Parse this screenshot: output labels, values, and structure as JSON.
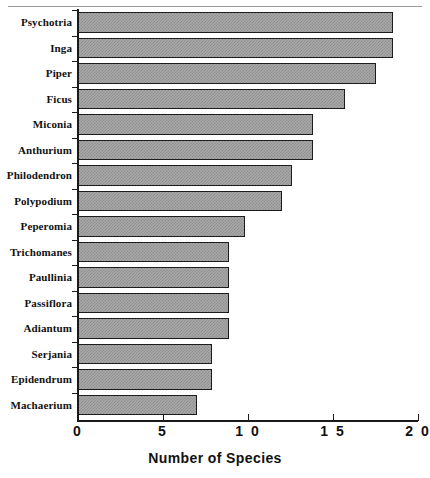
{
  "chart_data": {
    "type": "bar",
    "orientation": "horizontal",
    "title": "",
    "xlabel": "Number of Species",
    "ylabel": "",
    "xlim": [
      0,
      20
    ],
    "ylim": null,
    "grid": false,
    "legend": null,
    "xticks": [
      0,
      5,
      10,
      15,
      20
    ],
    "xtick_labels": [
      "0",
      "5",
      "1 0",
      "1 5",
      "2 0"
    ],
    "categories": [
      "Psychotria",
      "Inga",
      "Piper",
      "Ficus",
      "Miconia",
      "Anthurium",
      "Philodendron",
      "Polypodium",
      "Peperomia",
      "Trichomanes",
      "Paullinia",
      "Passiflora",
      "Adiantum",
      "Serjania",
      "Epidendrum",
      "Machaerium"
    ],
    "values": [
      18.5,
      18.5,
      17.5,
      15.7,
      13.8,
      13.8,
      12.6,
      12.0,
      9.8,
      8.9,
      8.9,
      8.9,
      8.9,
      7.9,
      7.9,
      7.0
    ],
    "bar_fill_color": "#a8a8a8",
    "bar_edge_color": "#1c1c1c",
    "axis_color": "#1a1a1a",
    "background_color": "#ffffff"
  },
  "axis": {
    "x_title": "Number of Species"
  }
}
